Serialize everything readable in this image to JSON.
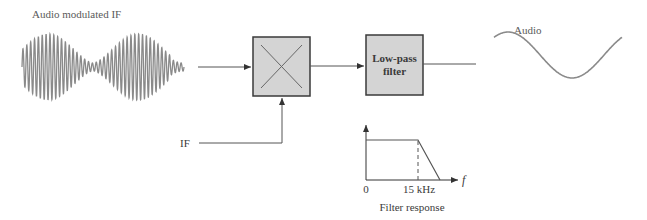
{
  "diagram": {
    "colors": {
      "line": "#555555",
      "box_fill": "#d4d4d4",
      "box_stroke": "#3a3a3a",
      "wave": "#8a8a8a",
      "text": "#5a5a5a"
    },
    "input": {
      "label": "Audio modulated IF",
      "waveform": "am-modulated-carrier"
    },
    "blocks": [
      {
        "id": "mixer",
        "label": "",
        "symbol": "multiply-cross"
      },
      {
        "id": "lpf",
        "label_line1": "Low-pass",
        "label_line2": "filter"
      }
    ],
    "reference_input": {
      "label": "IF"
    },
    "output": {
      "label": "Audio",
      "waveform": "sine"
    },
    "filter_response": {
      "caption": "Filter response",
      "x_axis_label": "f",
      "tick_zero": "0",
      "tick_cutoff": "15 kHz"
    }
  },
  "chart_data": {
    "type": "line",
    "title": "Filter response",
    "xlabel": "f",
    "ylabel": "",
    "x": [
      "0",
      "15 kHz",
      "roll-off end"
    ],
    "series": [
      {
        "name": "Low-pass magnitude",
        "values": [
          1,
          1,
          0
        ]
      }
    ],
    "annotations": [
      "dashed line at 15 kHz cutoff"
    ]
  }
}
